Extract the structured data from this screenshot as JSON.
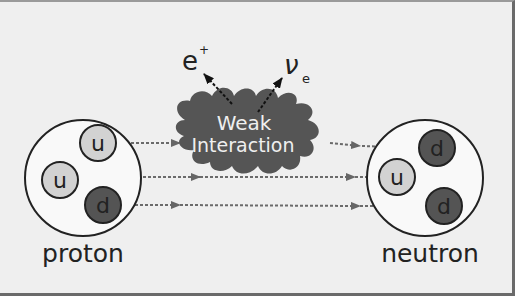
{
  "diagram": {
    "colors": {
      "background": "#efefef",
      "frame_border": "#6a6a6a",
      "up_quark": "#d2d2d2",
      "down_quark": "#545454",
      "blob": "#555555",
      "arrow": "#666666",
      "text": "#222222"
    },
    "proton": {
      "label": "proton",
      "quarks": [
        {
          "flavor": "u",
          "type": "up"
        },
        {
          "flavor": "u",
          "type": "up"
        },
        {
          "flavor": "d",
          "type": "down"
        }
      ]
    },
    "neutron": {
      "label": "neutron",
      "quarks": [
        {
          "flavor": "d",
          "type": "down"
        },
        {
          "flavor": "u",
          "type": "up"
        },
        {
          "flavor": "d",
          "type": "down"
        }
      ]
    },
    "interaction": {
      "line1": "Weak",
      "line2": "Interaction"
    },
    "products": {
      "positron": {
        "base": "e",
        "sup": "+"
      },
      "neutrino": {
        "base": "ν",
        "sub": "e"
      }
    }
  }
}
